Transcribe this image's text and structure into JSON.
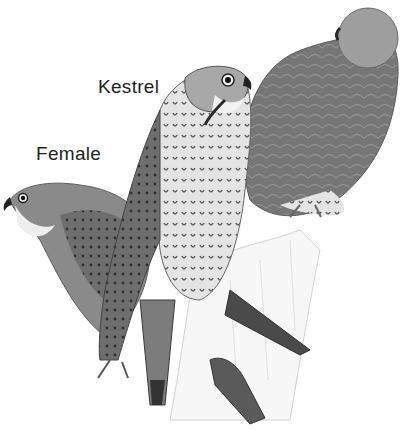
{
  "illustration": {
    "subject": "Kestrel birds perched on a post",
    "style": "grayscale field-guide drawing",
    "labels": {
      "kestrel": "Kestrel",
      "female": "Female"
    },
    "birds": [
      {
        "name": "male-kestrel-back",
        "position": "right",
        "pose": "turned away, head turned left"
      },
      {
        "name": "kestrel-center",
        "position": "center",
        "pose": "upright, facing right"
      },
      {
        "name": "female-kestrel",
        "position": "left",
        "pose": "leaning, facing left"
      }
    ],
    "colors": {
      "background": "#ffffff",
      "text": "#1e1e1e",
      "dark_feather": "#4a4a4a",
      "mid_feather": "#7a7a7a",
      "light_feather": "#cfcfcf"
    }
  }
}
